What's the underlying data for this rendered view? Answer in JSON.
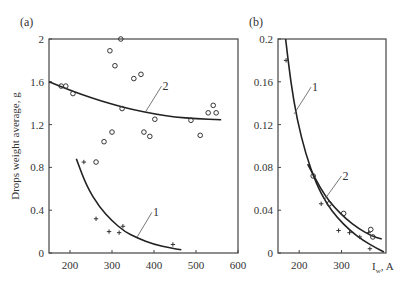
{
  "chart_data": [
    {
      "panel_label": "(a)",
      "type": "scatter",
      "title": "",
      "xlabel": "",
      "ylabel": "Drops weight average, g",
      "xlim": [
        150,
        600
      ],
      "ylim": [
        0,
        2
      ],
      "xticks": [
        200,
        300,
        400,
        500,
        600
      ],
      "yticks": [
        0,
        0.4,
        0.8,
        1.2,
        1.6,
        2
      ],
      "ytick_labels": [
        "0",
        "0.4",
        "0.8",
        "1.2",
        "1.6",
        "2"
      ],
      "grid": false,
      "series": [
        {
          "name": "1",
          "marker": "plus",
          "points": [
            [
              233,
              0.85
            ],
            [
              262,
              0.32
            ],
            [
              293,
              0.2
            ],
            [
              317,
              0.19
            ],
            [
              326,
              0.25
            ],
            [
              445,
              0.08
            ]
          ]
        },
        {
          "name": "2",
          "marker": "circle",
          "points": [
            [
              179,
              1.56
            ],
            [
              190,
              1.56
            ],
            [
              207,
              1.49
            ],
            [
              262,
              0.85
            ],
            [
              281,
              1.04
            ],
            [
              295,
              1.89
            ],
            [
              300,
              1.13
            ],
            [
              307,
              1.75
            ],
            [
              321,
              2.0
            ],
            [
              324,
              1.35
            ],
            [
              352,
              1.63
            ],
            [
              369,
              1.67
            ],
            [
              376,
              1.13
            ],
            [
              390,
              1.09
            ],
            [
              402,
              1.25
            ],
            [
              488,
              1.24
            ],
            [
              510,
              1.1
            ],
            [
              529,
              1.31
            ],
            [
              541,
              1.38
            ],
            [
              548,
              1.31
            ]
          ]
        }
      ],
      "curves": [
        {
          "name": "1",
          "points": [
            [
              215,
              0.88
            ],
            [
              240,
              0.62
            ],
            [
              270,
              0.43
            ],
            [
              300,
              0.3
            ],
            [
              330,
              0.2
            ],
            [
              360,
              0.14
            ],
            [
              400,
              0.08
            ],
            [
              440,
              0.045
            ],
            [
              465,
              0.03
            ]
          ],
          "label_anchor": [
            360,
            0.15
          ],
          "label_pos": [
            395,
            0.38
          ]
        },
        {
          "name": "2",
          "points": [
            [
              150,
              1.6
            ],
            [
              200,
              1.52
            ],
            [
              250,
              1.45
            ],
            [
              300,
              1.39
            ],
            [
              350,
              1.34
            ],
            [
              400,
              1.3
            ],
            [
              450,
              1.27
            ],
            [
              500,
              1.255
            ],
            [
              560,
              1.245
            ]
          ],
          "label_anchor": [
            380,
            1.32
          ],
          "label_pos": [
            418,
            1.56
          ]
        }
      ],
      "annotations": [
        "1",
        "2"
      ]
    },
    {
      "panel_label": "(b)",
      "type": "scatter",
      "title": "",
      "xlabel": "I_w, A",
      "ylabel": "",
      "xlim": [
        150,
        405
      ],
      "ylim": [
        0,
        0.2
      ],
      "xticks": [
        200,
        300
      ],
      "yticks": [
        0,
        0.04,
        0.08,
        0.12,
        0.16,
        0.2
      ],
      "ytick_labels": [
        "0",
        "0.04",
        "0.08",
        "0.12",
        "0.16",
        "0.2"
      ],
      "grid": false,
      "series": [
        {
          "name": "1",
          "marker": "plus",
          "points": [
            [
              169,
              0.18
            ],
            [
              252,
              0.046
            ],
            [
              293,
              0.021
            ],
            [
              319,
              0.019
            ],
            [
              343,
              0.015
            ],
            [
              364,
              0.019
            ],
            [
              367,
              0.004
            ]
          ]
        },
        {
          "name": "2",
          "marker": "circle",
          "points": [
            [
              233,
              0.072
            ],
            [
              271,
              0.046
            ],
            [
              305,
              0.037
            ],
            [
              369,
              0.022
            ],
            [
              374,
              0.015
            ]
          ]
        }
      ],
      "curves": [
        {
          "name": "1",
          "points": [
            [
              168,
              0.2
            ],
            [
              180,
              0.16
            ],
            [
              195,
              0.125
            ],
            [
              215,
              0.093
            ],
            [
              240,
              0.065
            ],
            [
              265,
              0.046
            ],
            [
              290,
              0.033
            ],
            [
              320,
              0.021
            ],
            [
              350,
              0.012
            ],
            [
              380,
              0.005
            ],
            [
              400,
              0.001
            ]
          ],
          "label_anchor": [
            188,
            0.13
          ],
          "label_pos": [
            228,
            0.155
          ]
        },
        {
          "name": "2",
          "points": [
            [
              220,
              0.083
            ],
            [
              240,
              0.068
            ],
            [
              260,
              0.054
            ],
            [
              285,
              0.042
            ],
            [
              310,
              0.032
            ],
            [
              340,
              0.023
            ],
            [
              370,
              0.016
            ],
            [
              395,
              0.013
            ]
          ],
          "label_anchor": [
            260,
            0.05
          ],
          "label_pos": [
            300,
            0.072
          ]
        }
      ],
      "annotations": [
        "1",
        "2"
      ]
    }
  ]
}
